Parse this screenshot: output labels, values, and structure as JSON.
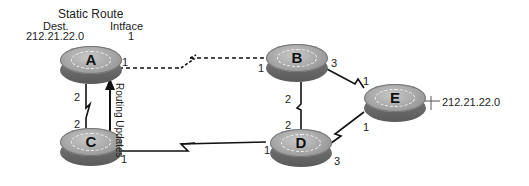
{
  "static_route": {
    "title": "Static Route",
    "col_dest": "Dest.",
    "col_intf": "Intface",
    "dest_value": "212.21.22.0",
    "intf_value": "1"
  },
  "routers": {
    "A": {
      "label": "A"
    },
    "B": {
      "label": "B"
    },
    "C": {
      "label": "C"
    },
    "D": {
      "label": "D"
    },
    "E": {
      "label": "E"
    }
  },
  "interfaces": {
    "A_to_B": "1",
    "A_to_C": "2",
    "C_to_A": "2",
    "C_to_D": "1",
    "B_to_A": "1",
    "B_to_E": "3",
    "B_to_D": "2",
    "D_to_B": "2",
    "D_to_C": "1",
    "D_to_E": "3",
    "E_to_B": "1",
    "E_to_D": "1"
  },
  "routing_updates_label": "Routing Updates",
  "network": {
    "address": "212.21.22.0"
  },
  "links": [
    {
      "from": "A",
      "to": "B",
      "style": "dashed-serial"
    },
    {
      "from": "A",
      "to": "C",
      "style": "serial"
    },
    {
      "from": "C",
      "to": "D",
      "style": "serial"
    },
    {
      "from": "B",
      "to": "D",
      "style": "serial"
    },
    {
      "from": "B",
      "to": "E",
      "style": "serial"
    },
    {
      "from": "D",
      "to": "E",
      "style": "serial"
    }
  ],
  "colors": {
    "line": "#111111",
    "router_top": "#a8a8a8",
    "router_side": "#666666"
  }
}
